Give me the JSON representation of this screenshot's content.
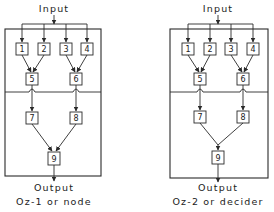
{
  "diagrams": [
    {
      "id": "left",
      "input_label": "Input",
      "output_label": "Output",
      "caption": "Oz-1 or node",
      "nodes": [
        "1",
        "2",
        "3",
        "4",
        "5",
        "6",
        "7",
        "8",
        "9"
      ],
      "merge_style": "separate arrows into 9"
    },
    {
      "id": "right",
      "input_label": "Input",
      "output_label": "Output",
      "caption": "Oz-2 or decider",
      "nodes": [
        "1",
        "2",
        "3",
        "4",
        "5",
        "6",
        "7",
        "8",
        "9"
      ],
      "merge_style": "junction then single arrow into 9"
    }
  ],
  "edges": [
    [
      "input",
      "1"
    ],
    [
      "input",
      "2"
    ],
    [
      "input",
      "3"
    ],
    [
      "input",
      "4"
    ],
    [
      "1",
      "5"
    ],
    [
      "2",
      "5"
    ],
    [
      "3",
      "6"
    ],
    [
      "4",
      "6"
    ],
    [
      "5",
      "7"
    ],
    [
      "6",
      "8"
    ],
    [
      "7",
      "9"
    ],
    [
      "8",
      "9"
    ],
    [
      "9",
      "output"
    ]
  ],
  "colors": {
    "line": "#2a2a2a",
    "text": "#222222",
    "background": "#ffffff"
  }
}
